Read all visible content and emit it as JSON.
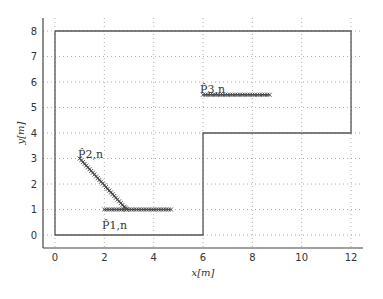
{
  "chart_data": {
    "type": "line",
    "title": "",
    "xlabel": "x[m]",
    "ylabel": "y[m]",
    "xlim": [
      -0.5,
      12.5
    ],
    "ylim": [
      -0.5,
      8.5
    ],
    "xticks": [
      0,
      2,
      4,
      6,
      8,
      10,
      12
    ],
    "yticks": [
      0,
      1,
      2,
      3,
      4,
      5,
      6,
      7,
      8
    ],
    "grid": true,
    "legend": null,
    "boundary": {
      "name": "environment outline",
      "x": [
        0,
        12,
        12,
        6,
        6,
        0,
        0
      ],
      "y": [
        8,
        8,
        4,
        4,
        0,
        0,
        8
      ]
    },
    "series": [
      {
        "name": "P1,n",
        "label": "P̂₁,ₙ",
        "x": [
          2.0,
          2.3,
          2.6,
          2.9,
          3.2,
          3.5,
          3.8,
          4.1,
          4.4,
          4.7
        ],
        "y": [
          1,
          1,
          1,
          1,
          1,
          1,
          1,
          1,
          1,
          1
        ]
      },
      {
        "name": "P2,n",
        "label": "P̂₂,ₙ",
        "x": [
          1.0,
          1.2,
          1.4,
          1.6,
          1.8,
          2.0,
          2.2,
          2.4,
          2.6,
          2.8,
          2.9
        ],
        "y": [
          3.0,
          2.79,
          2.58,
          2.37,
          2.16,
          1.95,
          1.74,
          1.53,
          1.32,
          1.11,
          1.0
        ]
      },
      {
        "name": "P3,n",
        "label": "P̂₃,ₙ",
        "x": [
          6.0,
          6.3,
          6.6,
          6.9,
          7.2,
          7.5,
          7.8,
          8.1,
          8.4,
          8.7
        ],
        "y": [
          5.5,
          5.5,
          5.5,
          5.5,
          5.5,
          5.5,
          5.5,
          5.5,
          5.5,
          5.5
        ]
      }
    ],
    "annotations": [
      {
        "text": "P̂2,n",
        "x": 1.0,
        "y": 3.2
      },
      {
        "text": "P̂1,n",
        "x": 2.0,
        "y": 0.55
      },
      {
        "text": "P̂3,n",
        "x": 6.0,
        "y": 5.7
      }
    ]
  },
  "labels": {
    "xlabel": "x[m]",
    "ylabel": "y[m]",
    "p1": "P̂1,n",
    "p2": "P̂2,n",
    "p3": "P̂3,n"
  }
}
